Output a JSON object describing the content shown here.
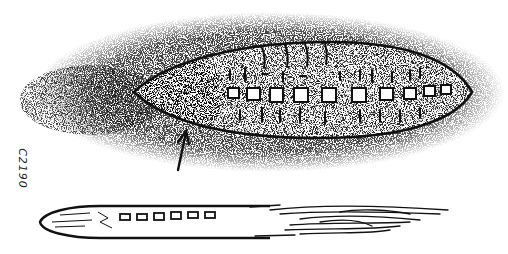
{
  "drawing": {
    "title": "Hand-drawn sketch of cigar-shaped object",
    "catalog_number": "C2190",
    "colors": {
      "ink": "#111111",
      "paper": "#ffffff",
      "stipple": "#333333"
    },
    "upper_object": {
      "description": "elongated lens-shaped craft with row of windows, surrounded by stippled haze",
      "window_count": 10,
      "left_tip": [
        134,
        92
      ],
      "right_tip": [
        472,
        92
      ],
      "top_y": 42,
      "bottom_y": 138
    },
    "arrow": {
      "description": "hand-drawn arrow pointing up to underside of upper object",
      "from": [
        176,
        170
      ],
      "to": [
        186,
        130
      ]
    },
    "lower_object": {
      "description": "slender cigar shape with row of windows and streaked trailing exhaust",
      "window_count": 6,
      "left_tip": [
        40,
        223
      ],
      "trail_end": [
        448,
        212
      ]
    }
  }
}
